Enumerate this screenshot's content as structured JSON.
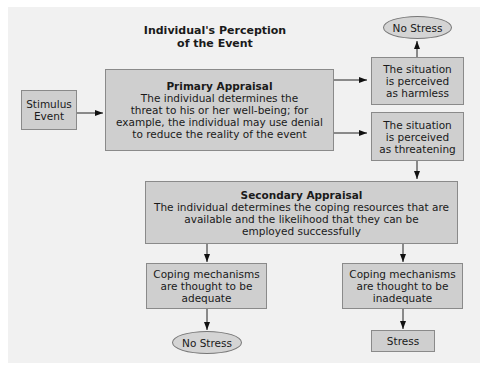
{
  "diagram": {
    "title_line1": "Individual's Perception",
    "title_line2": "of the Event",
    "stimulus": {
      "line1": "Stimulus",
      "line2": "Event"
    },
    "primary": {
      "title": "Primary Appraisal",
      "lines": [
        "The individual determines the",
        "threat to his or her well-being;  for",
        "example, the individual may use denial",
        "to reduce the reality of the event"
      ]
    },
    "harmless": {
      "lines": [
        "The situation",
        "is perceived",
        "as harmless"
      ]
    },
    "threatening": {
      "lines": [
        "The situation",
        "is perceived",
        "as threatening"
      ]
    },
    "no_stress_top": "No Stress",
    "secondary": {
      "title": "Secondary Appraisal",
      "lines": [
        "The individual determines the coping resources that are",
        "available and the likelihood that they can be",
        "employed successfully"
      ]
    },
    "adequate": {
      "lines": [
        "Coping mechanisms",
        "are thought to be",
        "adequate"
      ]
    },
    "inadequate": {
      "lines": [
        "Coping mechanisms",
        "are thought to be",
        "inadequate"
      ]
    },
    "no_stress_bottom": "No Stress",
    "stress": "Stress"
  }
}
